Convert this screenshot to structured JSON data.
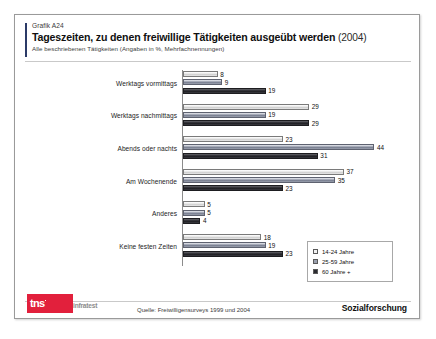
{
  "header": {
    "graphic_number": "Grafik A24",
    "title": "Tageszeiten, zu denen freiwillige Tätigkeiten ausgeübt werden",
    "title_year": "(2004)",
    "subtitle": "Alle beschriebenen Tätigkeiten (Angaben in %, Mehrfachnennungen)"
  },
  "footer": {
    "logo_main": "tns",
    "logo_sub": "infratest",
    "source": "Quelle: Freiwilligensurveys 1999 und 2004",
    "division": "Sozialforschung"
  },
  "legend": {
    "items": [
      {
        "label": "14-24 Jahre",
        "color": "#f2f2f2"
      },
      {
        "label": "25-59 Jahre",
        "color": "#9aa0ae"
      },
      {
        "label": "60 Jahre +",
        "color": "#2b2b30"
      }
    ]
  },
  "chart_data": {
    "type": "bar",
    "orientation": "horizontal",
    "title": "Tageszeiten, zu denen freiwillige Tätigkeiten ausgeübt werden (2004)",
    "subtitle": "Alle beschriebenen Tätigkeiten (Angaben in %, Mehrfachnennungen)",
    "xlabel": "",
    "ylabel": "",
    "unit": "%",
    "xlim": [
      0,
      50
    ],
    "grid": false,
    "legend_position": "bottom-right",
    "categories": [
      "Werktags vormittags",
      "Werktags nachmittags",
      "Abends oder nachts",
      "Am Wochenende",
      "Anderes",
      "Keine festen Zeiten"
    ],
    "series": [
      {
        "name": "14-24 Jahre",
        "values": [
          8,
          29,
          23,
          37,
          5,
          18
        ]
      },
      {
        "name": "25-59 Jahre",
        "values": [
          9,
          19,
          44,
          35,
          5,
          19
        ]
      },
      {
        "name": "60 Jahre +",
        "values": [
          19,
          29,
          31,
          23,
          4,
          23
        ]
      }
    ]
  }
}
